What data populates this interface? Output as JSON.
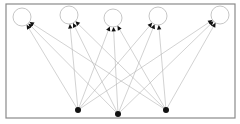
{
  "diagram": {
    "type": "bipartite-directed-graph",
    "frame": {
      "x": 6,
      "y": 4,
      "width": 229,
      "height": 114,
      "stroke": "#8a8a8a"
    },
    "top_nodes": [
      {
        "id": "t1",
        "x": 22,
        "y": 17,
        "r": 9,
        "fill": "#ffffff"
      },
      {
        "id": "t2",
        "x": 69,
        "y": 15,
        "r": 9,
        "fill": "#ffffff"
      },
      {
        "id": "t3",
        "x": 113,
        "y": 18,
        "r": 9,
        "fill": "#ffffff"
      },
      {
        "id": "t4",
        "x": 158,
        "y": 16,
        "r": 9,
        "fill": "#ffffff"
      },
      {
        "id": "t5",
        "x": 220,
        "y": 15,
        "r": 9,
        "fill": "#ffffff"
      }
    ],
    "bottom_nodes": [
      {
        "id": "b1",
        "x": 78,
        "y": 110,
        "r": 3,
        "fill": "#111111"
      },
      {
        "id": "b2",
        "x": 118,
        "y": 114,
        "r": 3,
        "fill": "#111111"
      },
      {
        "id": "b3",
        "x": 166,
        "y": 110,
        "r": 3,
        "fill": "#111111"
      }
    ],
    "edges": [
      {
        "from": "b1",
        "to": "t1"
      },
      {
        "from": "b1",
        "to": "t2"
      },
      {
        "from": "b1",
        "to": "t3"
      },
      {
        "from": "b1",
        "to": "t4"
      },
      {
        "from": "b1",
        "to": "t5"
      },
      {
        "from": "b2",
        "to": "t1"
      },
      {
        "from": "b2",
        "to": "t2"
      },
      {
        "from": "b2",
        "to": "t3"
      },
      {
        "from": "b2",
        "to": "t4"
      },
      {
        "from": "b2",
        "to": "t5"
      },
      {
        "from": "b3",
        "to": "t1"
      },
      {
        "from": "b3",
        "to": "t2"
      },
      {
        "from": "b3",
        "to": "t3"
      },
      {
        "from": "b3",
        "to": "t4"
      },
      {
        "from": "b3",
        "to": "t5"
      }
    ],
    "edge_color": "#b4b4b4",
    "arrowhead_color": "#111111"
  }
}
